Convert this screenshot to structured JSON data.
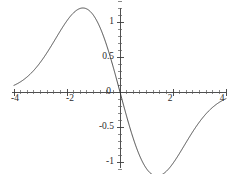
{
  "chart_data": {
    "type": "line",
    "title": "",
    "subtitle": "",
    "xlabel": "",
    "ylabel": "",
    "xlim": [
      -4,
      4
    ],
    "ylim": [
      -1.35,
      1.35
    ],
    "grid": false,
    "legend": null,
    "legend_position": "none",
    "axis_style": "centered-cross",
    "line_color": "#2b2b2b",
    "axis_color": "#3c3c3c",
    "background_color": "#ffffff",
    "x_ticks_major": [
      -4,
      -2,
      0,
      2,
      4
    ],
    "x_tick_labels": [
      "-4",
      "-2",
      "0",
      "2",
      "4"
    ],
    "x_ticks_minor_step": 0.25,
    "y_ticks_major": [
      -1,
      -0.5,
      0.5,
      1
    ],
    "y_tick_labels": [
      "-1",
      "-0.5",
      "0.5",
      "1"
    ],
    "y_ticks_minor_step": 0.1,
    "zero_label": "0",
    "series": [
      {
        "name": "f(x)",
        "expression": "-1.2 * (x/1.4) * exp(0.5*(1-(x/1.4)^2))",
        "peak": {
          "x": -1.4,
          "y": 1.2
        },
        "trough": {
          "x": 1.4,
          "y": -1.2
        },
        "zero_crossings": [
          0
        ],
        "x": [
          -4.0,
          -3.8,
          -3.6,
          -3.4,
          -3.2,
          -3.0,
          -2.8,
          -2.6,
          -2.4,
          -2.2,
          -2.0,
          -1.8,
          -1.6,
          -1.4,
          -1.2,
          -1.0,
          -0.8,
          -0.6,
          -0.4,
          -0.2,
          0.0,
          0.2,
          0.4,
          0.6,
          0.8,
          1.0,
          1.2,
          1.4,
          1.6,
          1.8,
          2.0,
          2.2,
          2.4,
          2.6,
          2.8,
          3.0,
          3.2,
          3.4,
          3.6,
          3.8,
          4.0
        ],
        "values": [
          0.063,
          0.087,
          0.117,
          0.155,
          0.202,
          0.258,
          0.324,
          0.4,
          0.484,
          0.574,
          0.667,
          0.758,
          0.84,
          0.909,
          0.957,
          0.981,
          0.977,
          0.943,
          0.88,
          0.791,
          0.0,
          -0.791,
          -0.88,
          -0.943,
          -0.977,
          -0.981,
          -0.957,
          -0.909,
          -0.84,
          -0.758,
          -0.667,
          -0.574,
          -0.484,
          -0.4,
          -0.324,
          -0.258,
          -0.202,
          -0.155,
          -0.117,
          -0.087,
          -0.063
        ]
      }
    ]
  },
  "labels": {
    "x_neg4": "-4",
    "x_neg2": "-2",
    "origin": "0",
    "x_pos2": "2",
    "x_pos4": "4",
    "y_pos1": "1",
    "y_pos05": "0.5",
    "y_neg05": "-0.5",
    "y_neg1": "-1"
  }
}
